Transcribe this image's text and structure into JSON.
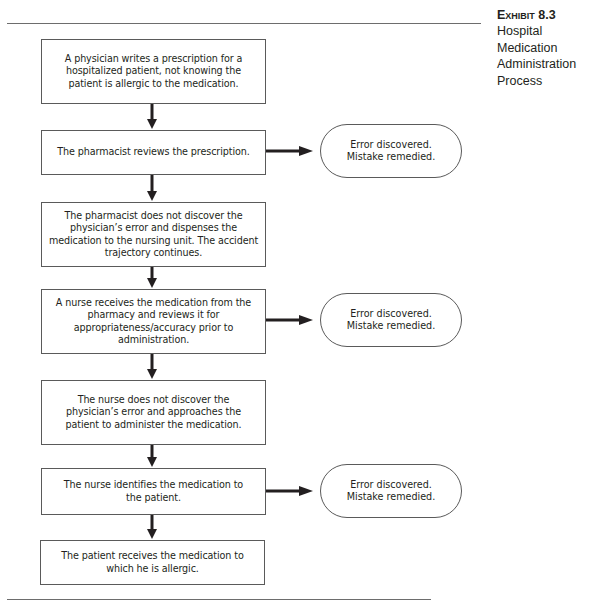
{
  "exhibit": {
    "label": "Exhibit 8.3",
    "title_lines": [
      "Hospital",
      "Medication",
      "Administration",
      "Process"
    ]
  },
  "flowchart": {
    "steps": [
      {
        "text": "A physician writes a prescription for a\nhospitalized patient, not knowing the\npatient is allergic to the medication."
      },
      {
        "text": "The pharmacist reviews the prescription."
      },
      {
        "text": "The pharmacist does not discover the\nphysician’s error and dispenses the\nmedication to the nursing unit. The accident\ntrajectory continues."
      },
      {
        "text": "A nurse receives the medication from the\npharmacy and reviews it for\nappropriateness/accuracy prior to\nadministration."
      },
      {
        "text": "The nurse does not discover the\nphysician’s error and approaches the\npatient to administer the medication."
      },
      {
        "text": "The nurse identifies the medication to\nthe patient."
      },
      {
        "text": "The patient receives the medication to\nwhich he is allergic."
      }
    ],
    "outcomes": [
      {
        "from_step": 2,
        "text": "Error discovered.\nMistake remedied."
      },
      {
        "from_step": 4,
        "text": "Error discovered.\nMistake remedied."
      },
      {
        "from_step": 6,
        "text": "Error discovered.\nMistake remedied."
      }
    ]
  }
}
